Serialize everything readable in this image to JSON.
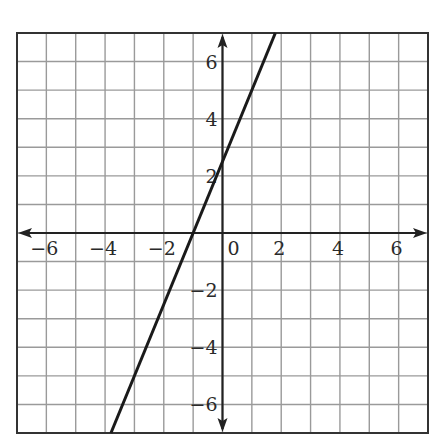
{
  "chart_data": {
    "type": "line",
    "title": "",
    "xlabel": "",
    "ylabel": "",
    "xlim": [
      -7,
      7
    ],
    "ylim": [
      -7,
      7
    ],
    "grid": true,
    "grid_step": 1,
    "x_tick_labels": [
      "−6",
      "−4",
      "−2",
      "0",
      "2",
      "4",
      "6"
    ],
    "x_tick_values": [
      -6,
      -4,
      -2,
      0,
      2,
      4,
      6
    ],
    "y_tick_labels": [
      "6",
      "4",
      "2",
      "−2",
      "−4",
      "−6"
    ],
    "y_tick_values": [
      6,
      4,
      2,
      -2,
      -4,
      -6
    ],
    "series": [
      {
        "name": "line",
        "equation": "y = 2.5x + 2.5",
        "x": [
          -3.8,
          1.8
        ],
        "y": [
          -7,
          7
        ],
        "x_intercept": -1,
        "y_intercept": 2.5
      }
    ],
    "axes_arrows": true
  },
  "colors": {
    "grid": "#9a9a9a",
    "axis": "#222222",
    "line": "#1a1a1a",
    "border": "#333333"
  }
}
